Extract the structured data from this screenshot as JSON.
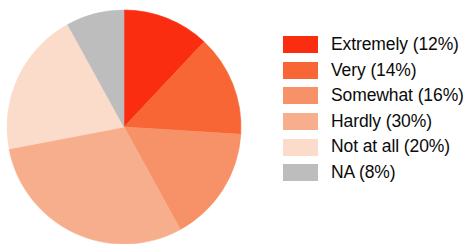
{
  "chart_data": {
    "type": "pie",
    "title": "",
    "subtitle": "",
    "xlabel": "",
    "ylabel": "",
    "grid": false,
    "legend_position": "right",
    "start_angle_deg": 0,
    "direction": "clockwise",
    "categories": [
      "Extremely",
      "Very",
      "Somewhat",
      "Hardly",
      "Not at all",
      "NA"
    ],
    "values": [
      12,
      14,
      16,
      30,
      20,
      8
    ],
    "value_unit": "%",
    "labels": [
      "Extremely (12%)",
      "Very (14%)",
      "Somewhat (16%)",
      "Hardly (30%)",
      "Not at all (20%)",
      "NA (8%)"
    ],
    "colors": [
      "#fa2d10",
      "#f96636",
      "#f79268",
      "#f7ae8c",
      "#fbdccb",
      "#bdbdbd"
    ],
    "slices": [
      {
        "label": "Extremely (12%)",
        "name": "Extremely",
        "value": 12,
        "color": "#fa2d10"
      },
      {
        "label": "Very (14%)",
        "name": "Very",
        "value": 14,
        "color": "#f96636"
      },
      {
        "label": "Somewhat (16%)",
        "name": "Somewhat",
        "value": 16,
        "color": "#f79268"
      },
      {
        "label": "Hardly (30%)",
        "name": "Hardly",
        "value": 30,
        "color": "#f7ae8c"
      },
      {
        "label": "Not at all (20%)",
        "name": "Not at all",
        "value": 20,
        "color": "#fbdccb"
      },
      {
        "label": "NA (8%)",
        "name": "NA",
        "value": 8,
        "color": "#bdbdbd"
      }
    ]
  },
  "legend": {
    "items": [
      {
        "label": "Extremely (12%)",
        "color": "#fa2d10",
        "swatch_name": "legend-swatch-extremely"
      },
      {
        "label": "Very (14%)",
        "color": "#f96636",
        "swatch_name": "legend-swatch-very"
      },
      {
        "label": "Somewhat (16%)",
        "color": "#f79268",
        "swatch_name": "legend-swatch-somewhat"
      },
      {
        "label": "Hardly (30%)",
        "color": "#f7ae8c",
        "swatch_name": "legend-swatch-hardly"
      },
      {
        "label": "Not at all (20%)",
        "color": "#fbdccb",
        "swatch_name": "legend-swatch-not-at-all"
      },
      {
        "label": "NA (8%)",
        "color": "#bdbdbd",
        "swatch_name": "legend-swatch-na"
      }
    ]
  },
  "geometry": {
    "center_x": 124,
    "center_y": 127,
    "radius": 117
  }
}
